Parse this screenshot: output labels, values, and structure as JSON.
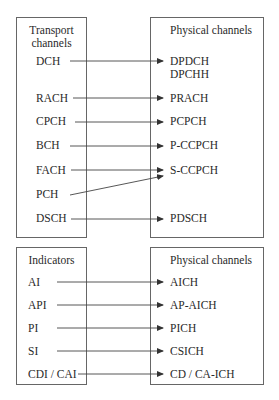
{
  "top": {
    "left_header": [
      "Transport",
      "channels"
    ],
    "right_header": "Physical channels",
    "left_items": [
      "DCH",
      "RACH",
      "CPCH",
      "BCH",
      "FACH",
      "PCH",
      "DSCH"
    ],
    "right_items": [
      "DPDCH",
      "DPCHH",
      "PRACH",
      "PCPCH",
      "P-CCPCH",
      "S-CCPCH",
      "PDSCH"
    ],
    "mappings": [
      {
        "from": "DCH",
        "to": "DPDCH"
      },
      {
        "from": "RACH",
        "to": "PRACH"
      },
      {
        "from": "CPCH",
        "to": "PCPCH"
      },
      {
        "from": "BCH",
        "to": "P-CCPCH"
      },
      {
        "from": "FACH",
        "to": "S-CCPCH"
      },
      {
        "from": "PCH",
        "to": "S-CCPCH"
      },
      {
        "from": "DSCH",
        "to": "PDSCH"
      }
    ]
  },
  "bottom": {
    "left_header": "Indicators",
    "right_header": "Physical channels",
    "left_items": [
      "AI",
      "API",
      "PI",
      "SI",
      "CDI / CAI"
    ],
    "right_items": [
      "AICH",
      "AP-AICH",
      "PICH",
      "CSICH",
      "CD / CA-ICH"
    ],
    "mappings": [
      {
        "from": "AI",
        "to": "AICH"
      },
      {
        "from": "API",
        "to": "AP-AICH"
      },
      {
        "from": "PI",
        "to": "PICH"
      },
      {
        "from": "SI",
        "to": "CSICH"
      },
      {
        "from": "CDI / CAI",
        "to": "CD / CA-ICH"
      }
    ]
  }
}
